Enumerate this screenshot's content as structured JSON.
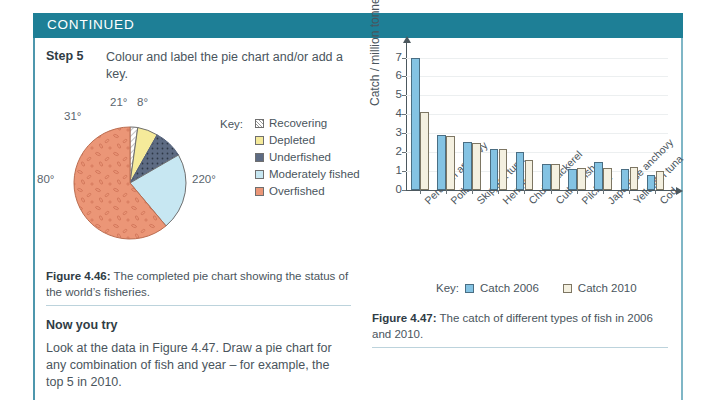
{
  "header": {
    "title": "CONTINUED"
  },
  "step": {
    "label": "Step 5",
    "text": "Colour and label the pie chart and/or add a key."
  },
  "pie": {
    "key_label": "Key:",
    "angle_labels": [
      "8°",
      "21°",
      "31°",
      "80°",
      "220°"
    ],
    "caption_bold": "Figure 4.46:",
    "caption_text": " The completed pie chart showing the status of the world’s fisheries."
  },
  "now_you_try": {
    "title": "Now you try",
    "text": "Look at the data in Figure 4.47. Draw a pie chart for any combination of fish and year – for example, the top 5 in 2010."
  },
  "bar_caption": {
    "bold": "Figure 4.47:",
    "text": " The catch of different types of fish in 2006 and 2010."
  },
  "colors": {
    "header_teal": "#1e7f96",
    "frame_teal": "#4d97ad",
    "catch_2006": "#84c3e3",
    "catch_2010": "#f4f0e0",
    "recovering": "#ffffff",
    "depleted": "#f5ea9a",
    "underfished": "#5d6b83",
    "moderately_fished": "#c7e7f2",
    "overfished": "#eb9677"
  },
  "chart_data": [
    {
      "type": "pie",
      "title": "Status of the world's fisheries",
      "categories": [
        "Recovering",
        "Depleted",
        "Underfished",
        "Moderately fished",
        "Overfished"
      ],
      "values": [
        8,
        21,
        31,
        80,
        220
      ],
      "value_unit": "degrees",
      "data_labels": [
        "8°",
        "21°",
        "31°",
        "80°",
        "220°"
      ],
      "colors": [
        "#ffffff",
        "#f5ea9a",
        "#5d6b83",
        "#c7e7f2",
        "#eb9677"
      ],
      "legend_title": "Key:",
      "legend_position": "right"
    },
    {
      "type": "bar",
      "title": "",
      "xlabel": "",
      "ylabel": "Catch / million tonnes",
      "ylim": [
        0,
        7.4
      ],
      "yticks": [
        0,
        1,
        2,
        3,
        4,
        5,
        6,
        7
      ],
      "grid": true,
      "legend_title": "Key:",
      "legend_position": "bottom",
      "categories": [
        "Peruvian anchovy",
        "Pollack",
        "Skipjack tuna",
        "Herring",
        "Chub mackerel",
        "Cutlassfish",
        "Pilchard",
        "Japanese anchovy",
        "Yellowfin tuna",
        "Cod"
      ],
      "series": [
        {
          "name": "Catch 2006",
          "color": "#84c3e3",
          "values": [
            7.0,
            2.9,
            2.55,
            2.17,
            2.0,
            1.4,
            1.1,
            1.5,
            1.1,
            0.78
          ]
        },
        {
          "name": "Catch 2010",
          "color": "#f4f0e0",
          "values": [
            4.15,
            2.88,
            2.5,
            2.17,
            1.6,
            1.37,
            1.18,
            1.18,
            1.2,
            1.03
          ]
        }
      ]
    }
  ]
}
